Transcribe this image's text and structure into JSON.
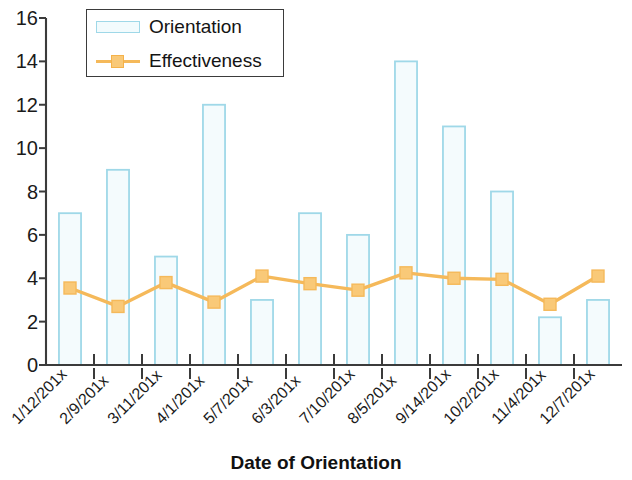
{
  "chart_data": {
    "type": "bar",
    "title": "",
    "xlabel": "Date of Orientation",
    "ylabel": "",
    "ylim": [
      0,
      16
    ],
    "ytick_step": 2,
    "yticks": [
      "0",
      "2",
      "4",
      "6",
      "8",
      "10",
      "12",
      "14",
      "16"
    ],
    "grid": false,
    "legend_position": "top-left inside plot",
    "categories": [
      "1/12/201x",
      "2/9/201x",
      "3/11/201x",
      "4/1/201x",
      "5/7/201x",
      "6/3/201x",
      "7/10/201x",
      "8/5/201x",
      "9/14/201x",
      "10/2/201x",
      "11/4/201x",
      "12/7/201x"
    ],
    "series": [
      {
        "name": "Orientation",
        "type": "bar",
        "color": "#9fd8e8",
        "fill": "#f4fbfd",
        "values": [
          7,
          9,
          5,
          12,
          3,
          7,
          6,
          14,
          11,
          8,
          2.2,
          3
        ]
      },
      {
        "name": "Effectiveness",
        "type": "line",
        "color": "#f5b95a",
        "marker_color": "#f9c978",
        "values": [
          3.55,
          2.7,
          3.8,
          2.9,
          4.1,
          3.75,
          3.45,
          4.25,
          4.0,
          3.95,
          2.8,
          4.1
        ]
      }
    ]
  },
  "legend": {
    "items": [
      {
        "label": "Orientation",
        "key": "bar"
      },
      {
        "label": "Effectiveness",
        "key": "line-marker"
      }
    ]
  },
  "axis": {
    "x_title": "Date of Orientation"
  },
  "colors": {
    "bar_outline": "#9fd8e8",
    "bar_fill": "#f4fbfd",
    "line": "#f5b95a",
    "marker": "#f9c978",
    "axis": "#3b3b3b",
    "text": "#1a1a1a"
  }
}
